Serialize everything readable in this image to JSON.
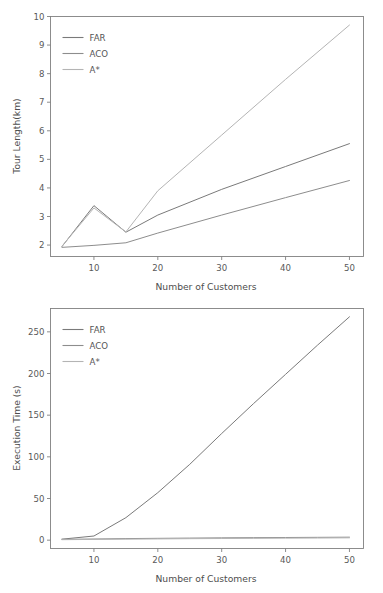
{
  "figure": {
    "width": 383,
    "height": 593,
    "background": "#ffffff",
    "panel_count": 2
  },
  "palette": {
    "far": "#7a7a7a",
    "aco": "#8d8d8d",
    "astar": "#b4b4b4",
    "axis": "#808080",
    "text": "#555555"
  },
  "chart_data": [
    {
      "type": "line",
      "id": "tour-length-chart",
      "title": "",
      "xlabel": "Number of Customers",
      "ylabel": "Tour Length(km)",
      "x": [
        5,
        10,
        15,
        20,
        30,
        40,
        50
      ],
      "xlim": [
        3.2,
        52.2
      ],
      "ylim": [
        1.6,
        10.0
      ],
      "xticks": [
        10,
        20,
        30,
        40,
        50
      ],
      "xticklabels": [
        "10",
        "20",
        "30",
        "40",
        "50"
      ],
      "yticks": [
        2,
        3,
        4,
        5,
        6,
        7,
        8,
        9,
        10
      ],
      "yticklabels": [
        "2",
        "3",
        "4",
        "5",
        "6",
        "7",
        "8",
        "9",
        "10"
      ],
      "grid": false,
      "legend_position": "upper left",
      "series": [
        {
          "name": "FAR",
          "color": "#7a7a7a",
          "values": [
            1.95,
            3.38,
            2.45,
            3.05,
            3.95,
            4.75,
            5.55
          ]
        },
        {
          "name": "ACO",
          "color": "#8d8d8d",
          "values": [
            1.92,
            1.99,
            2.08,
            2.42,
            3.05,
            3.66,
            4.26
          ]
        },
        {
          "name": "A*",
          "color": "#b4b4b4",
          "values": [
            1.96,
            3.3,
            2.46,
            3.9,
            5.85,
            7.8,
            9.7
          ]
        }
      ]
    },
    {
      "type": "line",
      "id": "execution-time-chart",
      "title": "",
      "xlabel": "Number of Customers",
      "ylabel": "Execution Time (s)",
      "x": [
        5,
        10,
        15,
        20,
        25,
        30,
        35,
        40,
        45,
        50
      ],
      "xlim": [
        3.2,
        52.2
      ],
      "ylim": [
        -10,
        278
      ],
      "xticks": [
        10,
        20,
        30,
        40,
        50
      ],
      "xticklabels": [
        "10",
        "20",
        "30",
        "40",
        "50"
      ],
      "yticks": [
        0,
        50,
        100,
        150,
        200,
        250
      ],
      "yticklabels": [
        "0",
        "50",
        "100",
        "150",
        "200",
        "250"
      ],
      "grid": false,
      "legend_position": "upper left",
      "series": [
        {
          "name": "FAR",
          "color": "#7a7a7a",
          "values": [
            1.2,
            5.0,
            27.0,
            57.0,
            91.0,
            128.0,
            164.0,
            199.0,
            234.0,
            268.0
          ]
        },
        {
          "name": "ACO",
          "color": "#8d8d8d",
          "values": [
            1.0,
            1.4,
            1.9,
            2.2,
            2.5,
            2.8,
            3.0,
            3.2,
            3.4,
            3.6
          ]
        },
        {
          "name": "A*",
          "color": "#b4b4b4",
          "values": [
            0.6,
            0.9,
            1.2,
            1.5,
            1.8,
            2.0,
            2.2,
            2.4,
            2.6,
            2.8
          ]
        }
      ]
    }
  ]
}
